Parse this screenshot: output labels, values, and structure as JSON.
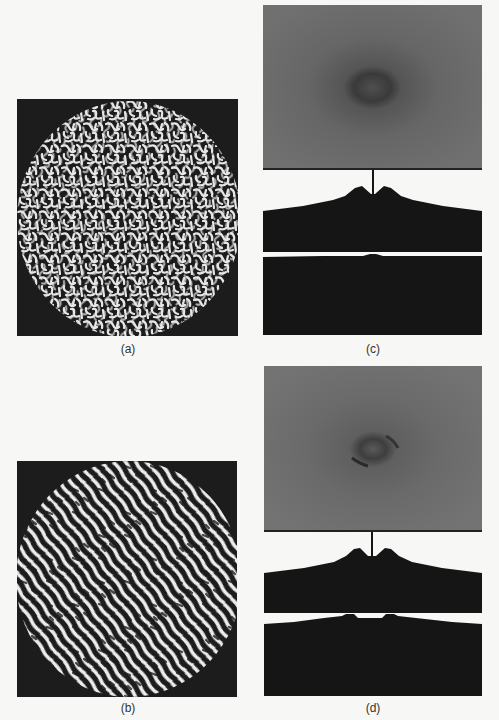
{
  "figure": {
    "panels": [
      {
        "id": "a",
        "label": "(a)",
        "description": "Circular region of disordered labyrinthine (worm-like) stripe pattern, white stripes on dark background"
      },
      {
        "id": "b",
        "label": "(b)",
        "description": "Circular region of partially aligned diagonal stripe pattern, white stripes on dark background"
      },
      {
        "id": "c",
        "label": "(c)",
        "description": "2D Fourier power spectrum (gray, faint dark isotropic ring) with 1D profile plots below showing two symmetric peaks and central spike"
      },
      {
        "id": "d",
        "label": "(d)",
        "description": "2D Fourier power spectrum with anisotropic ring and profile plots showing symmetric peaks in both directions"
      }
    ],
    "colors": {
      "background": "#f7f7f5",
      "pattern_dark": "#1c1c1c",
      "pattern_light": "#e8e8e8",
      "spectrum_gray": "#6a6a6a",
      "profile_fill": "#151515"
    }
  }
}
